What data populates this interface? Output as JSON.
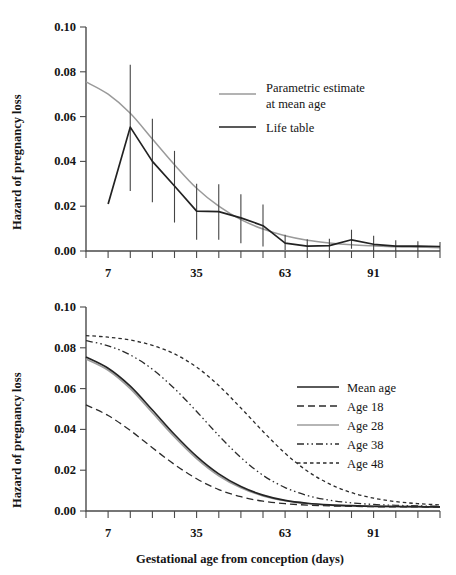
{
  "figure": {
    "xlabel": "Gestational age from conception (days)",
    "ylabel_top": "Hazard of pregnancy loss",
    "ylabel_bottom": "Hazard of pregnancy loss",
    "xticklabels": [
      "7",
      "35",
      "63",
      "91"
    ],
    "xtickvalues": [
      7,
      35,
      63,
      91
    ],
    "yticklabels": [
      "0.00",
      "0.02",
      "0.04",
      "0.06",
      "0.08",
      "0.10"
    ],
    "ytickvalues": [
      0.0,
      0.02,
      0.04,
      0.06,
      0.08,
      0.1
    ],
    "colors": {
      "life_table": "#222222",
      "parametric": "#9a9a9a",
      "mean_age": "#232323",
      "age_28": "#9d9d9d",
      "dashed_black": "#2b2b2b",
      "axis": "#4a4a4a"
    }
  },
  "chart_data": [
    {
      "type": "line",
      "panel": "top",
      "title": "",
      "xlabel": "",
      "ylabel": "Hazard of pregnancy loss",
      "xlim": [
        0,
        112
      ],
      "ylim": [
        0.0,
        0.1
      ],
      "xticks": [
        0,
        7,
        14,
        21,
        28,
        35,
        42,
        49,
        56,
        63,
        70,
        77,
        84,
        91,
        98,
        105,
        112
      ],
      "yticks": [
        0.0,
        0.02,
        0.04,
        0.06,
        0.08,
        0.1
      ],
      "grid": false,
      "legend_position": "upper-center-right",
      "series": [
        {
          "name": "Parametric estimate at mean age",
          "style": "solid",
          "color": "#9a9a9a",
          "x": [
            0,
            7,
            14,
            21,
            28,
            35,
            42,
            49,
            56,
            63,
            70,
            77,
            84,
            91,
            98,
            105,
            112
          ],
          "values": [
            0.0755,
            0.07,
            0.0615,
            0.05,
            0.0385,
            0.028,
            0.02,
            0.014,
            0.0098,
            0.0068,
            0.0048,
            0.0036,
            0.0028,
            0.0023,
            0.0019,
            0.0017,
            0.0015
          ]
        },
        {
          "name": "Life table",
          "style": "solid",
          "color": "#222222",
          "x": [
            7,
            14,
            21,
            28,
            35,
            42,
            49,
            56,
            63,
            70,
            77,
            84,
            91,
            98,
            105,
            112
          ],
          "values": [
            0.021,
            0.0553,
            0.04,
            0.029,
            0.0178,
            0.0176,
            0.0148,
            0.0113,
            0.0035,
            0.0022,
            0.0024,
            0.005,
            0.003,
            0.0022,
            0.0022,
            0.002
          ],
          "error_bars": {
            "lower": [
              0.021,
              0.0268,
              0.0218,
              0.0127,
              0.005,
              0.005,
              0.0035,
              0.002,
              0.0005,
              0.0,
              0.0,
              0.001,
              0.0,
              0.0,
              0.0,
              0.0
            ],
            "upper": [
              0.021,
              0.0832,
              0.059,
              0.0447,
              0.03,
              0.0298,
              0.0253,
              0.0208,
              0.0073,
              0.0052,
              0.0055,
              0.0095,
              0.0068,
              0.0048,
              0.0044,
              0.004
            ]
          }
        }
      ],
      "legend": [
        {
          "label_line1": "Parametric estimate",
          "label_line2": "at mean age",
          "style": "solid",
          "color": "#9a9a9a"
        },
        {
          "label_line1": "Life table",
          "label_line2": "",
          "style": "solid",
          "color": "#222222"
        }
      ]
    },
    {
      "type": "line",
      "panel": "bottom",
      "title": "",
      "xlabel": "Gestational age from conception (days)",
      "ylabel": "Hazard of pregnancy loss",
      "xlim": [
        0,
        112
      ],
      "ylim": [
        0.0,
        0.1
      ],
      "xticks": [
        0,
        7,
        14,
        21,
        28,
        35,
        42,
        49,
        56,
        63,
        70,
        77,
        84,
        91,
        98,
        105,
        112
      ],
      "yticks": [
        0.0,
        0.02,
        0.04,
        0.06,
        0.08,
        0.1
      ],
      "grid": false,
      "legend_position": "center-right",
      "x": [
        0,
        7,
        14,
        21,
        28,
        35,
        42,
        49,
        56,
        63,
        70,
        77,
        84,
        91,
        98,
        105,
        112
      ],
      "series": [
        {
          "name": "Mean age",
          "style": "solid",
          "color": "#232323",
          "values": [
            0.0755,
            0.07,
            0.0612,
            0.0495,
            0.0375,
            0.0268,
            0.0182,
            0.012,
            0.0078,
            0.0052,
            0.0038,
            0.003,
            0.0026,
            0.0023,
            0.0022,
            0.0021,
            0.002
          ]
        },
        {
          "name": "Age 18",
          "style": "dashed",
          "color": "#2b2b2b",
          "values": [
            0.052,
            0.0468,
            0.0395,
            0.031,
            0.0228,
            0.0158,
            0.0105,
            0.007,
            0.0048,
            0.0036,
            0.0029,
            0.0025,
            0.0023,
            0.0021,
            0.002,
            0.002,
            0.0019
          ]
        },
        {
          "name": "Age 28",
          "style": "solid",
          "color": "#9d9d9d",
          "values": [
            0.0745,
            0.069,
            0.06,
            0.0482,
            0.0363,
            0.0257,
            0.0173,
            0.0114,
            0.0074,
            0.005,
            0.0037,
            0.0029,
            0.0025,
            0.0023,
            0.0022,
            0.0021,
            0.002
          ]
        },
        {
          "name": "Age 38",
          "style": "dash-dot-dot",
          "color": "#2b2b2b",
          "values": [
            0.0835,
            0.081,
            0.0765,
            0.0695,
            0.06,
            0.0488,
            0.037,
            0.0262,
            0.0175,
            0.0115,
            0.0076,
            0.0053,
            0.004,
            0.0032,
            0.0028,
            0.0025,
            0.0023
          ]
        },
        {
          "name": "Age 48",
          "style": "dotted",
          "color": "#2b2b2b",
          "values": [
            0.086,
            0.0852,
            0.0838,
            0.0812,
            0.077,
            0.0705,
            0.0615,
            0.0505,
            0.039,
            0.0283,
            0.0196,
            0.0133,
            0.009,
            0.0063,
            0.0046,
            0.0036,
            0.003
          ]
        }
      ],
      "legend": [
        {
          "label": "Mean age",
          "style": "solid",
          "color": "#232323"
        },
        {
          "label": "Age 18",
          "style": "dashed",
          "color": "#2b2b2b"
        },
        {
          "label": "Age 28",
          "style": "solid",
          "color": "#9d9d9d"
        },
        {
          "label": "Age 38",
          "style": "dash-dot-dot",
          "color": "#2b2b2b"
        },
        {
          "label": "Age 48",
          "style": "dotted",
          "color": "#2b2b2b"
        }
      ]
    }
  ]
}
